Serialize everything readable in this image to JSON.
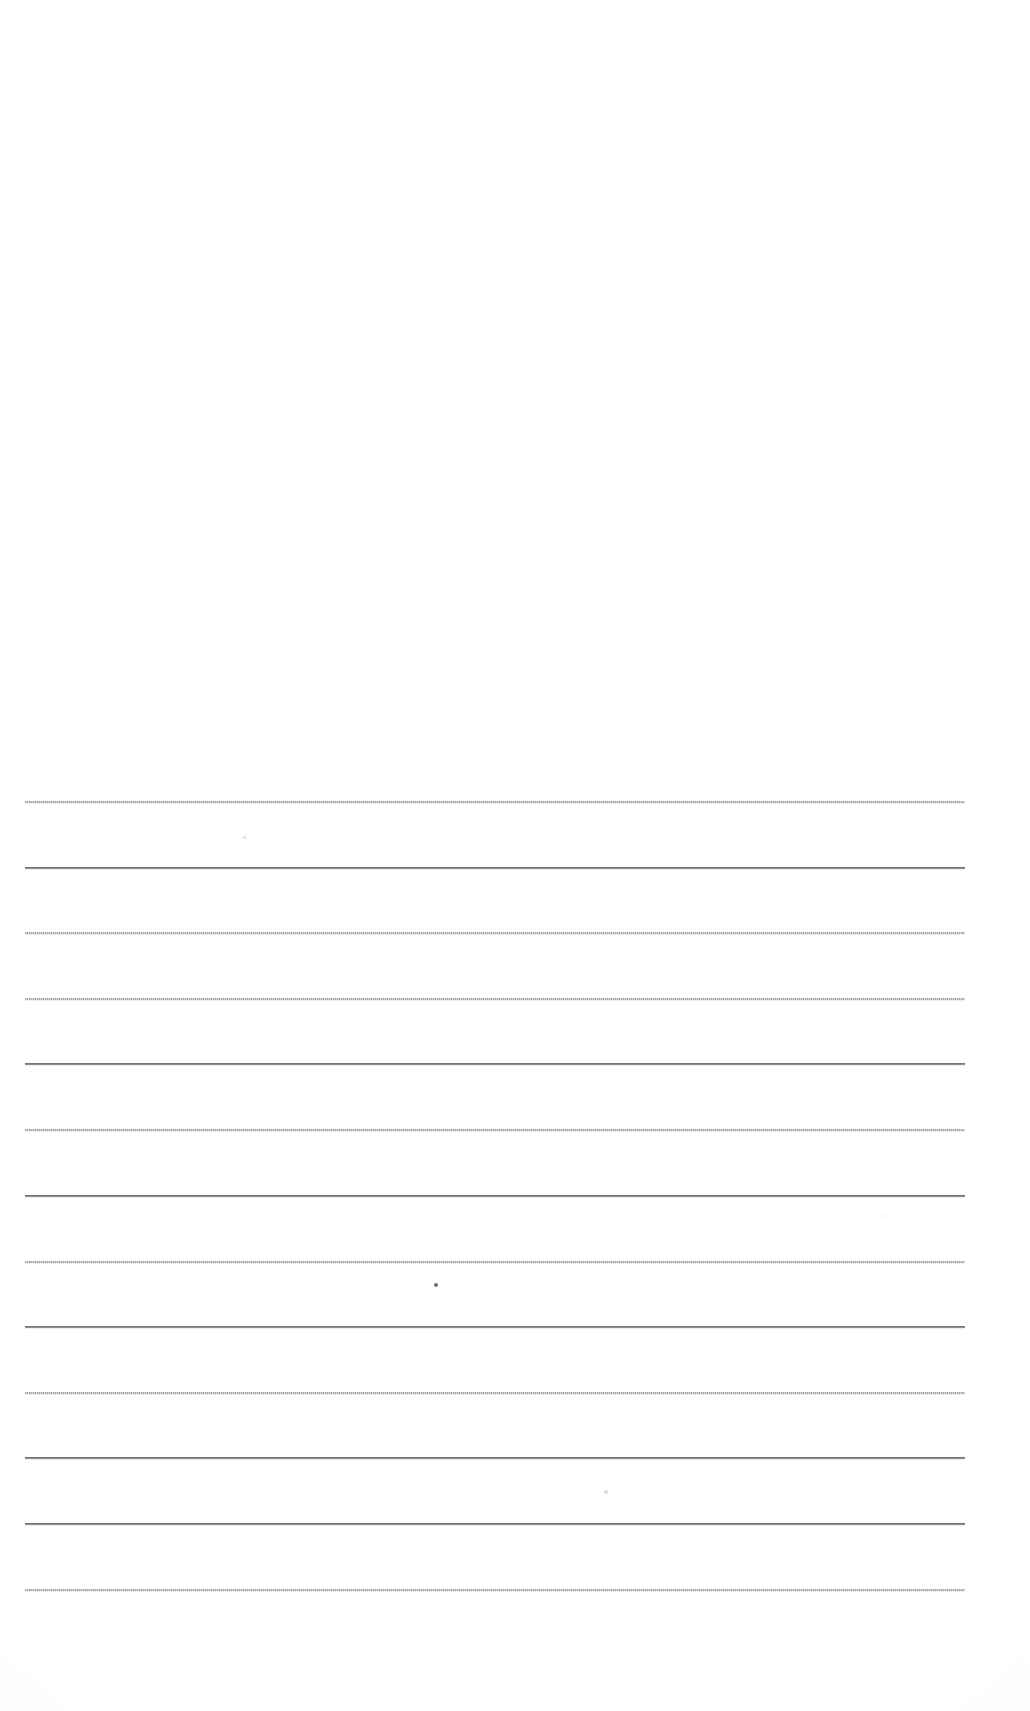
{
  "document": {
    "kind": "scanned-lined-paper",
    "title": "Blank ruled page",
    "page_width": 1030,
    "page_height": 1711,
    "background_color": "#ffffff",
    "text_content": "",
    "visible_text": []
  },
  "rules": {
    "count": 13,
    "left_x": 25,
    "right_x": 965,
    "spacing": 65.7,
    "color_light": "#a5a5ab",
    "color_dark": "#6e6e74",
    "lines": [
      {
        "y": 801,
        "weight": "light"
      },
      {
        "y": 867,
        "weight": "dark"
      },
      {
        "y": 932,
        "weight": "light"
      },
      {
        "y": 998,
        "weight": "light"
      },
      {
        "y": 1063,
        "weight": "dark"
      },
      {
        "y": 1129,
        "weight": "light"
      },
      {
        "y": 1195,
        "weight": "dark"
      },
      {
        "y": 1261,
        "weight": "light"
      },
      {
        "y": 1326,
        "weight": "dark"
      },
      {
        "y": 1392,
        "weight": "light"
      },
      {
        "y": 1457,
        "weight": "dark"
      },
      {
        "y": 1523,
        "weight": "dark"
      },
      {
        "y": 1589,
        "weight": "light"
      }
    ]
  },
  "artifacts": {
    "specks": [
      {
        "x": 243,
        "y": 836,
        "size": 3,
        "tone": "faint"
      },
      {
        "x": 434,
        "y": 1283,
        "size": 4,
        "tone": "dark"
      },
      {
        "x": 604,
        "y": 1490,
        "size": 4,
        "tone": "faint"
      },
      {
        "x": 884,
        "y": 1215,
        "size": 2,
        "tone": "faint"
      }
    ]
  },
  "blank_regions": {
    "header_note": "",
    "top_margin_height": 790,
    "bottom_margin_height": 122
  }
}
